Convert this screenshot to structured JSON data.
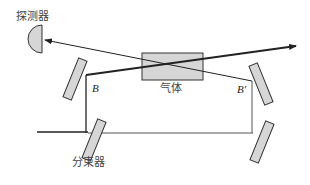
{
  "diagram": {
    "labels": {
      "detector": "探测器",
      "gas": "气体",
      "beam_splitter": "分束器",
      "point_b": "B",
      "point_b_prime": "B′"
    },
    "colors": {
      "line": "#222222",
      "component_fill": "#d6d6d6",
      "component_stroke": "#333333"
    }
  }
}
